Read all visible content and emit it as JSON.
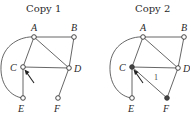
{
  "copies": [
    {
      "title": "Copy 1",
      "nodes": [
        {
          "id": "A",
          "label": "A",
          "x": 34,
          "y": 37,
          "filled": false
        },
        {
          "id": "B",
          "label": "B",
          "x": 74,
          "y": 37,
          "filled": false
        },
        {
          "id": "C",
          "label": "C",
          "x": 23,
          "y": 67,
          "filled": false
        },
        {
          "id": "D",
          "label": "D",
          "x": 69,
          "y": 68,
          "filled": false
        },
        {
          "id": "E",
          "label": "E",
          "x": 23,
          "y": 98,
          "filled": false
        },
        {
          "id": "F",
          "label": "F",
          "x": 58,
          "y": 98,
          "filled": false
        }
      ],
      "edges": [
        [
          "A",
          "B"
        ],
        [
          "A",
          "C"
        ],
        [
          "A",
          "D"
        ],
        [
          "B",
          "D"
        ],
        [
          "C",
          "D"
        ],
        [
          "C",
          "E"
        ],
        [
          "D",
          "F"
        ],
        [
          "A",
          "E",
          "arc"
        ]
      ],
      "arrow_target": "C"
    },
    {
      "title": "Copy 2",
      "nodes": [
        {
          "id": "A",
          "label": "A",
          "x": 143,
          "y": 37,
          "filled": false
        },
        {
          "id": "B",
          "label": "B",
          "x": 184,
          "y": 37,
          "filled": false
        },
        {
          "id": "C",
          "label": "C",
          "x": 132,
          "y": 67,
          "filled": true
        },
        {
          "id": "D",
          "label": "D",
          "x": 178,
          "y": 68,
          "filled": false
        },
        {
          "id": "E",
          "label": "E",
          "x": 132,
          "y": 98,
          "filled": false
        },
        {
          "id": "F",
          "label": "F",
          "x": 167,
          "y": 98,
          "filled": true
        }
      ],
      "edges": [
        [
          "A",
          "B"
        ],
        [
          "A",
          "C"
        ],
        [
          "A",
          "D"
        ],
        [
          "B",
          "D"
        ],
        [
          "C",
          "D"
        ],
        [
          "C",
          "E"
        ],
        [
          "C",
          "F"
        ],
        [
          "D",
          "F"
        ],
        [
          "A",
          "E",
          "arc"
        ]
      ],
      "edge_weight": {
        "edge": [
          "C",
          "F"
        ],
        "label": "1"
      },
      "arrow_target": "C"
    }
  ]
}
